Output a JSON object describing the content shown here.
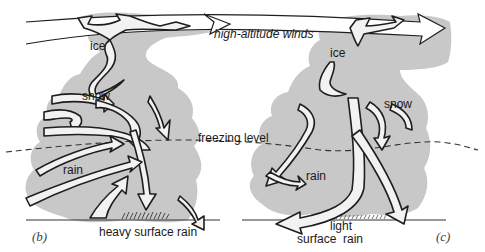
{
  "figure": {
    "colors": {
      "cloud": "#c8c8c8",
      "outline": "#1e1e1e",
      "arrow_fill": "#f2f2f2",
      "background": "#ffffff"
    },
    "top_label": "high-altitude winds",
    "freezing_label": "freezing level",
    "panels": [
      {
        "id": "b",
        "panel_label": "(b)",
        "labels": {
          "ice": "ice",
          "snow": "snow",
          "rain": "rain",
          "surface": "heavy surface rain"
        }
      },
      {
        "id": "c",
        "panel_label": "(c)",
        "labels": {
          "ice": "ice",
          "snow": "snow",
          "rain": "rain",
          "surface_line1": "light",
          "surface_line2": "surface  rain"
        }
      }
    ]
  }
}
